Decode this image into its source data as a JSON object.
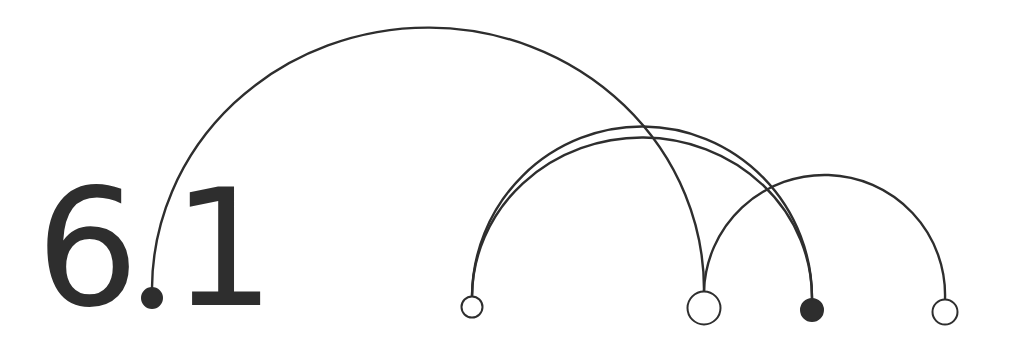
{
  "title": {
    "major": "6",
    "minor": "1",
    "color": "#2e2e2e"
  },
  "diagram": {
    "type": "arc-diagram",
    "stroke_color": "#2e2e2e",
    "nodes": [
      {
        "id": "n0",
        "x": 152,
        "y": 298,
        "r": 10,
        "style": "filled",
        "note": "decimal point of 6.1"
      },
      {
        "id": "n1",
        "x": 472,
        "y": 307,
        "r": 11,
        "style": "hollow"
      },
      {
        "id": "n2",
        "x": 704,
        "y": 308,
        "r": 17,
        "style": "hollow"
      },
      {
        "id": "n3",
        "x": 812,
        "y": 310,
        "r": 11,
        "style": "filled"
      },
      {
        "id": "n4",
        "x": 945,
        "y": 312,
        "r": 13,
        "style": "hollow"
      }
    ],
    "arcs": [
      {
        "from": "n0",
        "to": "n2",
        "peak_y": 28
      },
      {
        "from": "n1",
        "to": "n3",
        "peak_y": 125
      },
      {
        "from": "n1",
        "to": "n3",
        "peak_y": 136
      },
      {
        "from": "n2",
        "to": "n4",
        "peak_y": 176
      }
    ]
  }
}
